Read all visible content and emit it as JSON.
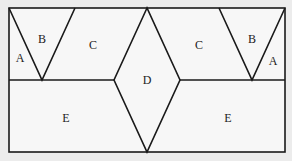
{
  "diagram": {
    "background": "#ececec",
    "panel_fill": "#f7f7f7",
    "stroke": "#1a1a1a",
    "labels": [
      {
        "id": "A-left",
        "text": "A",
        "x": 20,
        "y": 62
      },
      {
        "id": "B-left",
        "text": "B",
        "x": 42,
        "y": 43
      },
      {
        "id": "C-left",
        "text": "C",
        "x": 93,
        "y": 49
      },
      {
        "id": "D",
        "text": "D",
        "x": 147,
        "y": 84
      },
      {
        "id": "C-right",
        "text": "C",
        "x": 199,
        "y": 49
      },
      {
        "id": "B-right",
        "text": "B",
        "x": 252,
        "y": 43
      },
      {
        "id": "A-right",
        "text": "A",
        "x": 273,
        "y": 65
      },
      {
        "id": "E-left",
        "text": "E",
        "x": 66,
        "y": 122
      },
      {
        "id": "E-right",
        "text": "E",
        "x": 228,
        "y": 122
      }
    ]
  }
}
